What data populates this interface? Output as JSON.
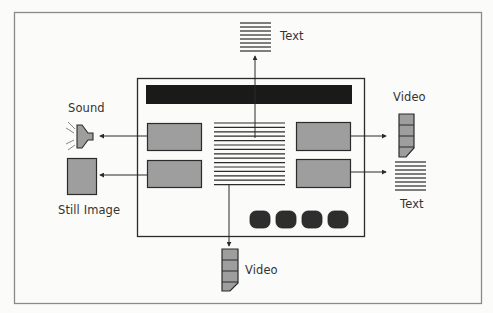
{
  "diagram": {
    "title": "",
    "colors": {
      "frame": "#8a8a8a",
      "box_fill": "#9e9e9e",
      "line": "#2b2b2b",
      "bar": "#1a1a1a",
      "button": "#2e2e2e",
      "background": "#fbfbf9"
    },
    "center": {
      "label": "Multimedia page",
      "elements": [
        "title-bar",
        "image-box-top-left",
        "image-box-bottom-left",
        "text-block",
        "image-box-top-right",
        "image-box-bottom-right",
        "nav-buttons"
      ],
      "button_count": 4
    },
    "outputs": [
      {
        "id": "text-top",
        "label": "Text",
        "icon": "text-lines-icon",
        "from": "text-block",
        "direction": "up"
      },
      {
        "id": "sound",
        "label": "Sound",
        "icon": "speaker-icon",
        "from": "image-box-top-left",
        "direction": "left"
      },
      {
        "id": "still-image",
        "label": "Still Image",
        "icon": "still-image-icon",
        "from": "image-box-bottom-left",
        "direction": "left"
      },
      {
        "id": "video-right",
        "label": "Video",
        "icon": "film-strip-icon",
        "from": "image-box-top-right",
        "direction": "right"
      },
      {
        "id": "text-right",
        "label": "Text",
        "icon": "text-lines-icon",
        "from": "image-box-bottom-right",
        "direction": "right"
      },
      {
        "id": "video-bottom",
        "label": "Video",
        "icon": "film-strip-icon",
        "from": "text-block",
        "direction": "down"
      }
    ]
  }
}
